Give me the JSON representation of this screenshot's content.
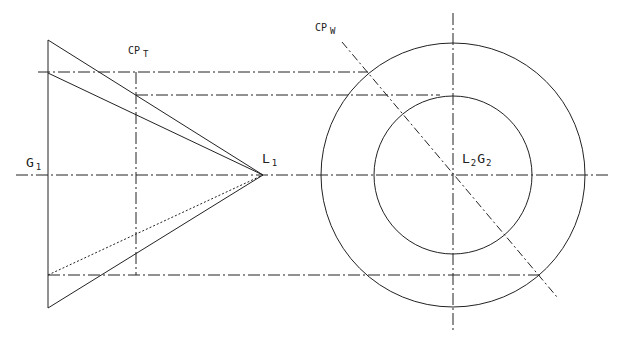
{
  "diagram": {
    "type": "technical-line-drawing",
    "colors": {
      "line": "#222222",
      "background": "#ffffff"
    },
    "labels": {
      "g1": {
        "main": "G",
        "sub": "1"
      },
      "l1": {
        "main": "L",
        "sub": "1"
      },
      "cpt": {
        "main": "CP",
        "sub": "T"
      },
      "cpw": {
        "main": "CP",
        "sub": "W"
      },
      "l2g2": {
        "main1": "L",
        "sub1": "2",
        "main2": "G",
        "sub2": "2"
      }
    }
  }
}
